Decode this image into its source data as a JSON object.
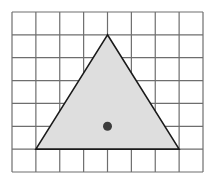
{
  "grid": {
    "columns": 8,
    "rows": 7,
    "line_color": "#6e6e6e"
  },
  "triangle": {
    "vertices_grid": [
      [
        4,
        1
      ],
      [
        1,
        6
      ],
      [
        7,
        6
      ]
    ],
    "fill_color": "#dedede",
    "stroke_color": "#1a1a1a"
  },
  "point": {
    "position_grid": [
      4,
      5
    ],
    "color": "#3c3c3c"
  }
}
